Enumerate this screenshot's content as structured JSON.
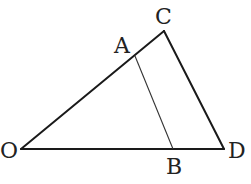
{
  "diagram": {
    "type": "geometry-figure",
    "stroke_color": "#1a1a1a",
    "points": {
      "O": {
        "label": "O",
        "x": 21,
        "y": 149
      },
      "A": {
        "label": "A",
        "x": 135,
        "y": 56
      },
      "C": {
        "label": "C",
        "x": 164,
        "y": 31
      },
      "B": {
        "label": "B",
        "x": 173,
        "y": 149
      },
      "D": {
        "label": "D",
        "x": 224,
        "y": 149
      }
    },
    "segments": [
      {
        "from": "O",
        "to": "C",
        "weight": "thick"
      },
      {
        "from": "C",
        "to": "D",
        "weight": "thick"
      },
      {
        "from": "O",
        "to": "D",
        "weight": "thick"
      },
      {
        "from": "A",
        "to": "B",
        "weight": "thin"
      }
    ],
    "labels": {
      "O": "O",
      "A": "A",
      "B": "B",
      "C": "C",
      "D": "D"
    }
  }
}
